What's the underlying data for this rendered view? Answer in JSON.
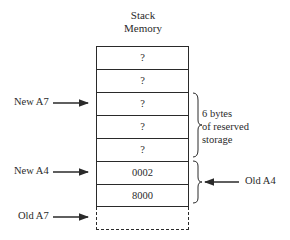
{
  "title": {
    "line1": "Stack",
    "line2": "Memory"
  },
  "stack": {
    "cells": [
      "?",
      "?",
      "?",
      "?",
      "?",
      "0002",
      "8000",
      ""
    ]
  },
  "pointers": {
    "new_a7": "New A7",
    "new_a4": "New A4",
    "old_a7": "Old A7",
    "old_a4": "Old A4"
  },
  "annotations": {
    "reserved_line1": "6 bytes",
    "reserved_line2": "of reserved",
    "reserved_line3": "storage"
  }
}
